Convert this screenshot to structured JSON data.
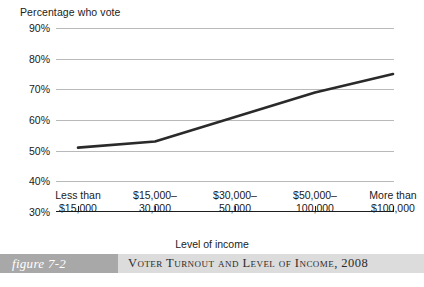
{
  "chart_data": {
    "type": "line",
    "title": "",
    "ylabel": "Percentage who vote",
    "xlabel": "Level of income",
    "ylim": [
      30,
      90
    ],
    "ytick_values": [
      90,
      80,
      70,
      60,
      50,
      40,
      30
    ],
    "ytick_labels": [
      "90%",
      "80%",
      "70%",
      "60%",
      "50%",
      "40%",
      "30%"
    ],
    "grid": true,
    "legend": "none",
    "categories": [
      "Less than $15,000",
      "$15,000–30,000",
      "$30,000–50,000",
      "$50,000–100,000",
      "More than $100,000"
    ],
    "category_lines": [
      [
        "Less than",
        "$15,000"
      ],
      [
        "$15,000–",
        "30,000"
      ],
      [
        "$30,000–",
        "50,000"
      ],
      [
        "$50,000–",
        "100,000"
      ],
      [
        "More than",
        "$100,000"
      ]
    ],
    "values": [
      51,
      53,
      61,
      69,
      75
    ],
    "series_color": "#2a2a2a",
    "gridline_color": "#b9b9b9",
    "axis_color": "#1d1d1d"
  },
  "caption": {
    "figure_number": "figure 7-2",
    "title": "Voter Turnout and Level of Income, 2008",
    "badge_color": "#a8a8a8",
    "bar_color": "#dcdcdc"
  },
  "page_bleed": {
    "text": ""
  }
}
